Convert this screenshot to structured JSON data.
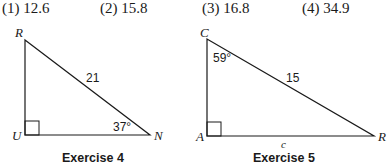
{
  "answer_choices": [
    {
      "number": "(1)",
      "value": "12.6",
      "label": "(1) 12.6"
    },
    {
      "number": "(2)",
      "value": "15.8",
      "label": "(2) 15.8"
    },
    {
      "number": "(3)",
      "value": "16.8",
      "label": "(3) 16.8"
    },
    {
      "number": "(4)",
      "value": "34.9",
      "label": "(4) 34.9"
    }
  ],
  "exercise4": {
    "caption": "Exercise 4",
    "vertices": {
      "top": "R",
      "right_angle": "U",
      "right": "N"
    },
    "hypotenuse_label": "21",
    "angle_label": "37°"
  },
  "exercise5": {
    "caption": "Exercise 5",
    "vertices": {
      "top": "C",
      "right_angle": "A",
      "right": "R"
    },
    "hypotenuse_label": "15",
    "angle_label": "59°",
    "base_label": "c"
  }
}
